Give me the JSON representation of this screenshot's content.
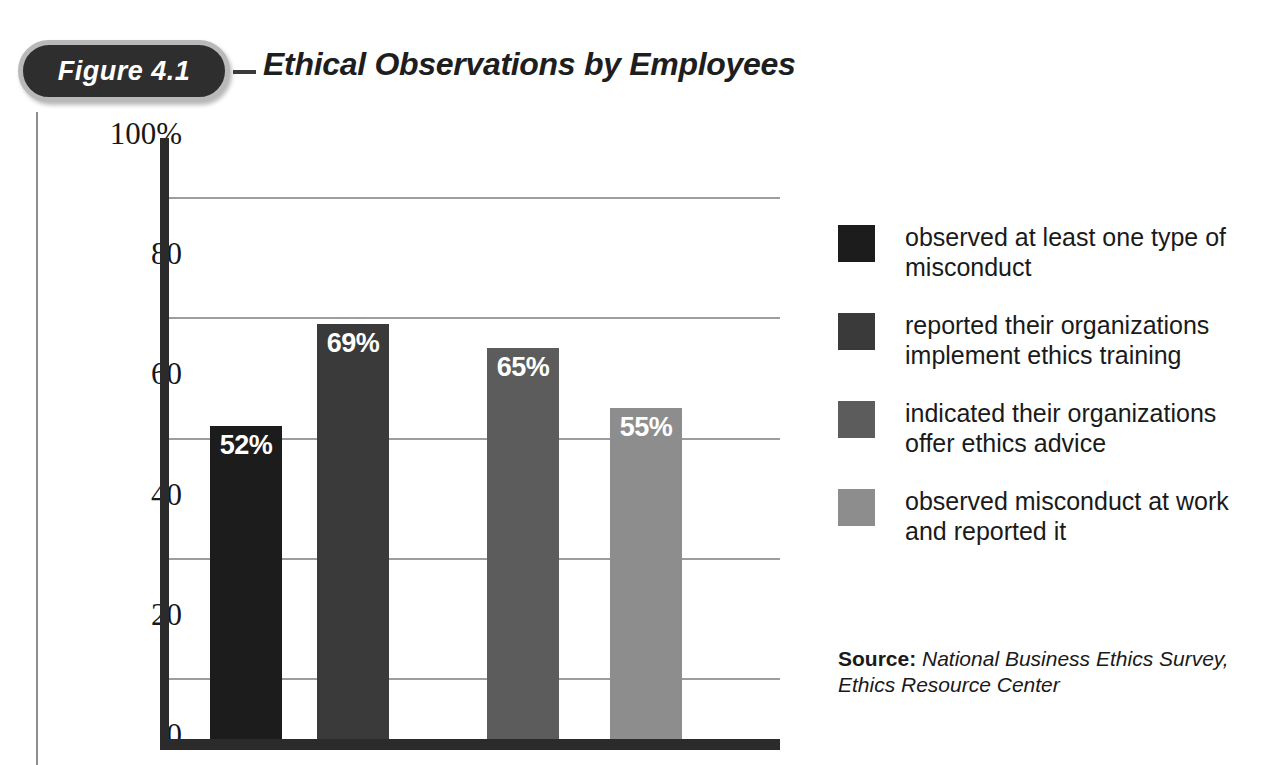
{
  "figure": {
    "badge_label": "Figure 4.1",
    "title": "Ethical Observations by Employees"
  },
  "source": {
    "label": "Source:",
    "text": " National Business Ethics Survey, Ethics Resource Center"
  },
  "colors": {
    "series_1": "#1c1c1c",
    "series_2": "#3a3a3a",
    "series_3": "#5c5c5c",
    "series_4": "#8d8d8d",
    "axis": "#2b2b2b",
    "gridline": "#9d9d9d",
    "badge_fill": "#2e2e2e",
    "badge_border": "#b9b9b9"
  },
  "chart_data": {
    "type": "bar",
    "title": "Ethical Observations by Employees",
    "xlabel": "",
    "ylabel": "",
    "ylim": [
      0,
      100
    ],
    "grid": true,
    "gridlines": [
      90,
      70,
      50,
      30,
      10
    ],
    "yticks": [
      "100%",
      "80",
      "60",
      "40",
      "20",
      "0"
    ],
    "ytick_values": [
      100,
      80,
      60,
      40,
      20,
      0
    ],
    "legend_position": "right",
    "categories": [
      "observed at least one type of misconduct",
      "reported their organizations implement ethics training",
      "indicated their organizations offer ethics advice",
      "observed misconduct at work and reported it"
    ],
    "values": [
      52,
      69,
      65,
      55
    ],
    "value_labels": [
      "52%",
      "69%",
      "65%",
      "55%"
    ],
    "series": [
      {
        "name": "observed at least one type of misconduct",
        "value": 52,
        "label": "52%",
        "color": "#1c1c1c"
      },
      {
        "name": "reported their organizations implement ethics training",
        "value": 69,
        "label": "69%",
        "color": "#3a3a3a"
      },
      {
        "name": "indicated their organizations offer ethics advice",
        "value": 65,
        "label": "65%",
        "color": "#5c5c5c"
      },
      {
        "name": "observed misconduct at work and reported it",
        "value": 55,
        "label": "55%",
        "color": "#8d8d8d"
      }
    ]
  },
  "legend": [
    {
      "label": "observed at least one type of misconduct",
      "color": "#1c1c1c"
    },
    {
      "label": "reported their organizations implement ethics training",
      "color": "#3a3a3a"
    },
    {
      "label": "indicated their organizations offer ethics advice",
      "color": "#5c5c5c"
    },
    {
      "label": "observed misconduct at work and reported it",
      "color": "#8d8d8d"
    }
  ]
}
